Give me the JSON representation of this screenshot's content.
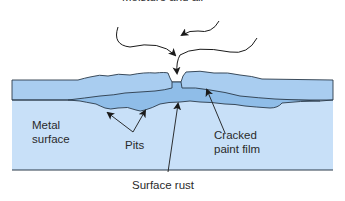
{
  "diagram": {
    "title": "Moisture and air",
    "labels": {
      "metal_surface_line1": "Metal",
      "metal_surface_line2": "surface",
      "pits": "Pits",
      "cracked_line1": "Cracked",
      "cracked_line2": "paint film",
      "surface_rust": "Surface rust"
    },
    "colors": {
      "paint_film": "#a9cdf0",
      "metal": "#c8e0f8",
      "rust": "#8fbde8",
      "outline": "#2a3a4a"
    }
  }
}
